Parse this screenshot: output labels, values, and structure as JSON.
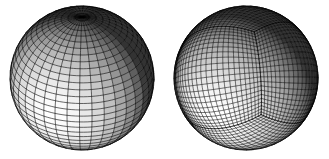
{
  "figure": {
    "title": "",
    "background_color": "#ffffff",
    "width": 329,
    "height": 159,
    "object_count": 2,
    "render_style": "shaded-wireframe-grayscale",
    "line_color": "#000000",
    "light_direction_hint": "upper-left",
    "objects": [
      {
        "name": "latitude-longitude-sphere",
        "label": "",
        "mesh_type": "spherical-polar",
        "center_x": 82,
        "center_y": 78,
        "radius": 72,
        "n_meridians": 36,
        "n_parallels": 32,
        "pole_screen_x": 84,
        "pole_screen_y": 23,
        "singularity_count": 1,
        "singularity_kind": "pole-convergence",
        "view_tilt_deg": 32,
        "view_azimuth_deg": 8,
        "shade_min": 0.1,
        "shade_max": 1.0,
        "highlight_x": 0.36,
        "highlight_y": 0.36
      },
      {
        "name": "cubed-sphere",
        "label": "",
        "mesh_type": "cubed-sphere-gnomonic",
        "center_x": 246,
        "center_y": 78,
        "radius": 72,
        "n_per_face": 22,
        "face_count_visible": 3,
        "corner_screen_x": 258,
        "corner_screen_y": 68,
        "singularity_count": 1,
        "singularity_kind": "cube-corner-vertex",
        "view_tilt_deg": 32,
        "view_azimuth_deg": 8,
        "shade_min": 0.1,
        "shade_max": 1.0,
        "highlight_x": 0.34,
        "highlight_y": 0.34
      }
    ]
  },
  "chart_data": {
    "type": "scatter",
    "title": "",
    "xlabel": "",
    "ylabel": "",
    "series": [
      {
        "name": "latitude-longitude-sphere",
        "values": [
          82,
          78,
          72
        ]
      },
      {
        "name": "cubed-sphere",
        "values": [
          246,
          78,
          72
        ]
      }
    ],
    "categories": [
      "center_x",
      "center_y",
      "radius"
    ]
  }
}
